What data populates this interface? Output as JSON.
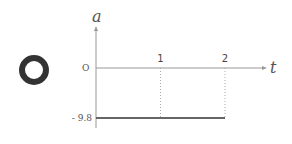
{
  "marker": {
    "label": "O-symbol",
    "icon": "circle-ring-icon"
  },
  "chart_data": {
    "type": "line",
    "title": "",
    "xlabel": "t",
    "ylabel": "a",
    "origin_label": "O",
    "x_ticks": [
      {
        "value": 1,
        "label": "1"
      },
      {
        "value": 2,
        "label": "2"
      }
    ],
    "y_ticks": [
      {
        "value": -9.8,
        "label": "- 9.8"
      }
    ],
    "xlim": [
      0,
      2.45
    ],
    "ylim": [
      -12,
      20
    ],
    "series": [
      {
        "name": "acceleration",
        "x": [
          0,
          2
        ],
        "y": [
          -9.8,
          -9.8
        ]
      }
    ],
    "guides": [
      {
        "x": 1,
        "from": 0,
        "to": -9.8
      },
      {
        "x": 2,
        "from": 0,
        "to": -9.8
      }
    ],
    "grid": false,
    "colors": {
      "axis": "#999999",
      "line": "#666666",
      "ring": "#333333"
    }
  }
}
